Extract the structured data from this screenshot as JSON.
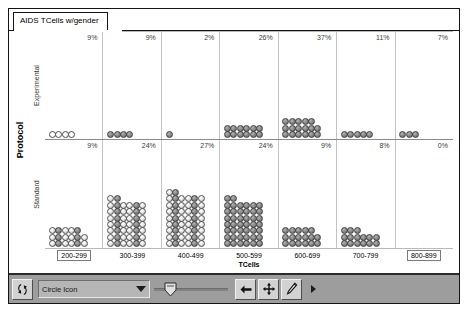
{
  "window": {
    "title": "AIDS TCells w/gender"
  },
  "axes": {
    "y_title": "Protocol",
    "x_title": "TCells",
    "panels": [
      "Experimental",
      "Standard"
    ],
    "x_ticks": [
      "200-299",
      "300-399",
      "400-499",
      "500-599",
      "600-699",
      "700-799",
      "800-899"
    ],
    "x_ticks_selected": [
      true,
      false,
      false,
      false,
      false,
      false,
      true
    ]
  },
  "chart_data": {
    "type": "bar",
    "subtype": "dot-plot-matrix",
    "title": "AIDS TCells w/gender",
    "xlabel": "TCells",
    "ylabel": "Protocol",
    "categories": [
      "200-299",
      "300-399",
      "400-499",
      "500-599",
      "600-699",
      "700-799",
      "800-899"
    ],
    "panel_rows": [
      "Experimental",
      "Standard"
    ],
    "legend": [
      {
        "name": "male",
        "style": "filled-gray-circle"
      },
      {
        "name": "female",
        "style": "hollow-white-circle"
      }
    ],
    "grid": true,
    "legend_position": "none",
    "series": [
      {
        "name": "Experimental",
        "labels": [
          "9%",
          "9%",
          "2%",
          "26%",
          "37%",
          "11%",
          "7%"
        ],
        "values": [
          9,
          9,
          2,
          26,
          37,
          11,
          7
        ],
        "dot_counts": [
          4,
          4,
          1,
          12,
          17,
          5,
          3
        ],
        "dot_fill": [
          "hollow",
          "male",
          "male",
          "male",
          "male",
          "male",
          "male"
        ],
        "dot_columns": [
          8,
          8,
          8,
          6,
          6,
          8,
          8
        ]
      },
      {
        "name": "Standard",
        "labels": [
          "9%",
          "24%",
          "27%",
          "24%",
          "9%",
          "8%",
          "0%"
        ],
        "values": [
          9,
          24,
          27,
          24,
          9,
          8,
          0
        ],
        "dot_counts": [
          17,
          44,
          50,
          44,
          17,
          15,
          0
        ],
        "dot_fill": [
          "mixed",
          "mixed",
          "mixed",
          "male",
          "male",
          "male",
          "none"
        ],
        "dot_columns": [
          6,
          6,
          6,
          6,
          6,
          6,
          6
        ]
      }
    ]
  },
  "toolbar": {
    "rotate_button": "rotate-tool",
    "icon_select_value": "Circle Icon",
    "size_slider": "icon-size-slider",
    "back_button": "back-arrow",
    "move_button": "move-tool",
    "edit_button": "pencil-tool",
    "overflow_button": "more-tools"
  }
}
